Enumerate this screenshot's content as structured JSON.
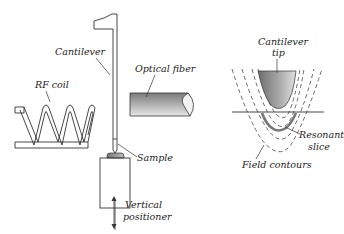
{
  "figure": {
    "left_panel": {
      "labels": {
        "cantilever": "Cantilever",
        "optical_fiber": "Optical fiber",
        "rf_coil": "RF coil",
        "sample": "Sample",
        "vertical_positioner_line1": "Vertical",
        "vertical_positioner_line2": "positioner"
      }
    },
    "right_panel": {
      "labels": {
        "cantilever_tip_line1": "Cantilever",
        "cantilever_tip_line2": "tip",
        "resonant_slice_line1": "Resonant",
        "resonant_slice_line2": "slice",
        "field_contours": "Field contours"
      }
    },
    "colors": {
      "line": "#333333",
      "gray_fill_dark": "#8a8a8a",
      "gray_fill_light": "#e6e6e6",
      "resonant_slice": "#777777"
    }
  }
}
